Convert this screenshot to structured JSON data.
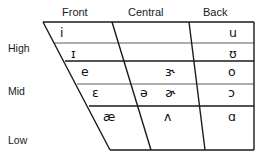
{
  "chart_title": "IPA Vowel Chart",
  "column_headers": [
    {
      "label": "Front",
      "x": 62,
      "y": 6
    },
    {
      "label": "Central",
      "x": 128,
      "y": 6
    },
    {
      "label": "Back",
      "x": 203,
      "y": 6
    }
  ],
  "row_labels": [
    {
      "label": "High",
      "x": 8,
      "y": 42
    },
    {
      "label": "Mid",
      "x": 8,
      "y": 85
    },
    {
      "label": "Low",
      "x": 8,
      "y": 134
    }
  ],
  "vowels": [
    {
      "symbol": "i",
      "name": "close-front-unrounded",
      "height": "High",
      "backness": "Front",
      "subrow": "upper",
      "x": 60,
      "y": 27
    },
    {
      "symbol": "ɪ",
      "name": "near-close-front-unrounded",
      "height": "High",
      "backness": "Front",
      "subrow": "lower",
      "x": 71,
      "y": 48
    },
    {
      "symbol": "u",
      "name": "close-back-rounded",
      "height": "High",
      "backness": "Back",
      "subrow": "upper",
      "x": 229,
      "y": 27
    },
    {
      "symbol": "ʊ",
      "name": "near-close-back-rounded",
      "height": "High",
      "backness": "Back",
      "subrow": "lower",
      "x": 229,
      "y": 48
    },
    {
      "symbol": "e",
      "name": "close-mid-front-unrounded",
      "height": "Mid",
      "backness": "Front",
      "subrow": "upper",
      "x": 81,
      "y": 66
    },
    {
      "symbol": "ɛ",
      "name": "open-mid-front-unrounded",
      "height": "Mid",
      "backness": "Front",
      "subrow": "lower",
      "x": 92,
      "y": 87
    },
    {
      "symbol": "ɝ",
      "name": "rhotic-open-mid-central",
      "height": "Mid",
      "backness": "Central",
      "subrow": "upper",
      "x": 165,
      "y": 66
    },
    {
      "symbol": "ə",
      "name": "schwa",
      "height": "Mid",
      "backness": "Central",
      "subrow": "lower",
      "x": 140,
      "y": 87
    },
    {
      "symbol": "ɚ",
      "name": "rhotic-schwa",
      "height": "Mid",
      "backness": "Central",
      "subrow": "lower",
      "x": 165,
      "y": 87
    },
    {
      "symbol": "o",
      "name": "close-mid-back-rounded",
      "height": "Mid",
      "backness": "Back",
      "subrow": "upper",
      "x": 228,
      "y": 66
    },
    {
      "symbol": "ɔ",
      "name": "open-mid-back-rounded",
      "height": "Mid",
      "backness": "Back",
      "subrow": "lower",
      "x": 228,
      "y": 87
    },
    {
      "symbol": "æ",
      "name": "near-open-front-unrounded",
      "height": "Low",
      "backness": "Front",
      "subrow": "upper",
      "x": 103,
      "y": 111
    },
    {
      "symbol": "ʌ",
      "name": "open-mid-back-unrounded",
      "height": "Low",
      "backness": "Central",
      "subrow": "upper",
      "x": 164,
      "y": 111
    },
    {
      "symbol": "ɑ",
      "name": "open-back-unrounded",
      "height": "Low",
      "backness": "Back",
      "subrow": "upper",
      "x": 228,
      "y": 111
    }
  ],
  "colors": {
    "line": "#1a1a1a",
    "thin_line": "#444444",
    "text": "#111111",
    "background": "#ffffff"
  },
  "geometry": {
    "top_y": 22,
    "bottom_y": 150,
    "right_x": 254,
    "left_top_x": 43,
    "left_bottom_x": 110,
    "div1_top_x": 112,
    "div1_bottom_x": 151,
    "div2_top_x": 189,
    "div2_bottom_x": 205,
    "high_mid_y": 61,
    "mid_low_y": 106,
    "high_sub_y": 43,
    "mid_sub_y": 84
  }
}
